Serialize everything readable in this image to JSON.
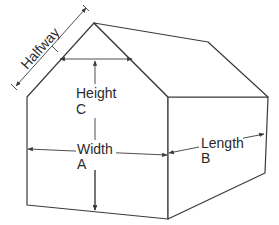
{
  "diagram": {
    "labels": {
      "halfway": "Halfway",
      "height": "Height",
      "height_var": "C",
      "width": "Width",
      "width_var": "A",
      "length": "Length",
      "length_var": "B"
    },
    "colors": {
      "line": "#3a3a3a",
      "text": "#2a2a2a",
      "background": "#ffffff"
    }
  }
}
